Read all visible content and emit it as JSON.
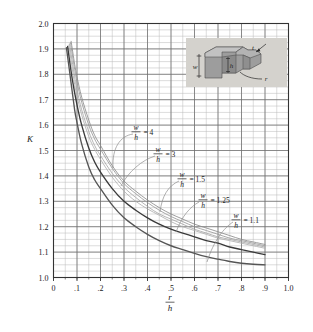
{
  "chart_data": {
    "type": "line",
    "title": "",
    "xlabel": "r/h",
    "xlabel_numerator": "r",
    "xlabel_denominator": "h",
    "ylabel": "K",
    "xlim": [
      0,
      1.0
    ],
    "ylim": [
      1.0,
      2.0
    ],
    "grid": true,
    "x_major_step": 0.1,
    "y_major_step": 0.1,
    "x_minor_step": 0.05,
    "y_minor_step": 0.025,
    "xticks": [
      "0",
      ".1",
      ".2",
      ".3",
      ".4",
      ".5",
      ".6",
      ".7",
      ".8",
      ".9",
      "1.0"
    ],
    "xtick_values": [
      0,
      0.1,
      0.2,
      0.3,
      0.4,
      0.5,
      0.6,
      0.7,
      0.8,
      0.9,
      1.0
    ],
    "yticks": [
      "1.0",
      "1.1",
      "1.2",
      "1.3",
      "1.4",
      "1.5",
      "1.6",
      "1.7",
      "1.8",
      "1.9",
      "2.0"
    ],
    "ytick_values": [
      1.0,
      1.1,
      1.2,
      1.3,
      1.4,
      1.5,
      1.6,
      1.7,
      1.8,
      1.9,
      2.0
    ],
    "legend_position": "inline-annotations",
    "series": [
      {
        "name": "w/h = 4",
        "label_numerator": "w",
        "label_denominator": "h",
        "label_value": "= 4",
        "color": "#8c8c8c",
        "x": [
          0.075,
          0.09,
          0.1,
          0.12,
          0.15,
          0.175,
          0.2,
          0.25,
          0.3,
          0.35,
          0.4,
          0.45,
          0.5,
          0.55,
          0.6,
          0.65,
          0.7,
          0.75,
          0.8,
          0.85,
          0.9
        ],
        "y": [
          1.93,
          1.84,
          1.79,
          1.71,
          1.62,
          1.56,
          1.52,
          1.44,
          1.38,
          1.34,
          1.305,
          1.275,
          1.25,
          1.23,
          1.21,
          1.195,
          1.18,
          1.165,
          1.15,
          1.14,
          1.13
        ]
      },
      {
        "name": "w/h = 3",
        "label_numerator": "w",
        "label_denominator": "h",
        "label_value": "= 3",
        "color": "#9a9a9a",
        "x": [
          0.072,
          0.09,
          0.1,
          0.12,
          0.15,
          0.175,
          0.2,
          0.25,
          0.3,
          0.35,
          0.4,
          0.45,
          0.5,
          0.55,
          0.6,
          0.65,
          0.7,
          0.75,
          0.8,
          0.85,
          0.9
        ],
        "y": [
          1.925,
          1.82,
          1.77,
          1.69,
          1.6,
          1.545,
          1.505,
          1.43,
          1.37,
          1.33,
          1.295,
          1.265,
          1.24,
          1.22,
          1.2,
          1.185,
          1.17,
          1.155,
          1.145,
          1.135,
          1.125
        ]
      },
      {
        "name": "w/h = 1.5",
        "label_numerator": "w",
        "label_denominator": "h",
        "label_value": "= 1.5",
        "color": "#a8a8a8",
        "x": [
          0.068,
          0.09,
          0.1,
          0.12,
          0.15,
          0.175,
          0.2,
          0.25,
          0.3,
          0.35,
          0.4,
          0.45,
          0.5,
          0.55,
          0.6,
          0.65,
          0.7,
          0.75,
          0.8,
          0.85,
          0.9
        ],
        "y": [
          1.92,
          1.79,
          1.74,
          1.66,
          1.575,
          1.52,
          1.48,
          1.41,
          1.355,
          1.315,
          1.28,
          1.25,
          1.23,
          1.21,
          1.19,
          1.175,
          1.16,
          1.15,
          1.14,
          1.13,
          1.12
        ]
      },
      {
        "name": "w/h = 1.25",
        "label_numerator": "w",
        "label_denominator": "h",
        "label_value": "= 1.25",
        "color": "#b0b0b0",
        "x": [
          0.065,
          0.09,
          0.1,
          0.12,
          0.15,
          0.175,
          0.2,
          0.25,
          0.3,
          0.35,
          0.4,
          0.45,
          0.5,
          0.55,
          0.6,
          0.65,
          0.7,
          0.75,
          0.8,
          0.85,
          0.9
        ],
        "y": [
          1.915,
          1.76,
          1.715,
          1.64,
          1.555,
          1.505,
          1.465,
          1.395,
          1.34,
          1.3,
          1.27,
          1.245,
          1.22,
          1.2,
          1.185,
          1.17,
          1.155,
          1.145,
          1.135,
          1.125,
          1.115
        ]
      },
      {
        "name": "w/h = 1.1",
        "label_numerator": "w",
        "label_denominator": "h",
        "label_value": "= 1.1",
        "color": "#3a3a3a",
        "x": [
          0.06,
          0.08,
          0.1,
          0.12,
          0.15,
          0.175,
          0.2,
          0.25,
          0.3,
          0.35,
          0.4,
          0.45,
          0.5,
          0.55,
          0.6,
          0.65,
          0.7,
          0.75,
          0.8,
          0.85,
          0.9
        ],
        "y": [
          1.91,
          1.78,
          1.68,
          1.6,
          1.51,
          1.455,
          1.415,
          1.35,
          1.3,
          1.265,
          1.235,
          1.21,
          1.19,
          1.175,
          1.16,
          1.145,
          1.135,
          1.12,
          1.11,
          1.1,
          1.09
        ]
      },
      {
        "name": "lower-bound-curve",
        "label_numerator": "",
        "label_denominator": "",
        "label_value": "",
        "color": "#555555",
        "x": [
          0.055,
          0.07,
          0.09,
          0.1,
          0.12,
          0.15,
          0.175,
          0.2,
          0.25,
          0.3,
          0.35,
          0.4,
          0.45,
          0.5,
          0.55,
          0.6,
          0.65,
          0.7,
          0.75,
          0.8,
          0.85,
          0.9
        ],
        "y": [
          1.905,
          1.8,
          1.66,
          1.61,
          1.525,
          1.435,
          1.385,
          1.35,
          1.285,
          1.235,
          1.2,
          1.17,
          1.145,
          1.125,
          1.11,
          1.095,
          1.082,
          1.072,
          1.063,
          1.056,
          1.052,
          1.05
        ]
      }
    ],
    "annotations": [
      {
        "name": "label-wh-4",
        "numerator": "w",
        "denominator": "h",
        "value": "= 4"
      },
      {
        "name": "label-wh-3",
        "numerator": "w",
        "denominator": "h",
        "value": "= 3"
      },
      {
        "name": "label-wh-1-5",
        "numerator": "w",
        "denominator": "h",
        "value": "= 1.5"
      },
      {
        "name": "label-wh-1-25",
        "numerator": "w",
        "denominator": "h",
        "value": "= 1.25"
      },
      {
        "name": "label-wh-1-1",
        "numerator": "w",
        "denominator": "h",
        "value": "= 1.1"
      }
    ],
    "inset": {
      "name": "stepped-bar-diagram",
      "labels": [
        "w",
        "h",
        "t",
        "r"
      ],
      "background": "#d4d2cd"
    },
    "colors": {
      "grid_major": "#6e6e6e",
      "grid_minor": "#b9b9b9",
      "axis": "#333333",
      "curve_dark": "#3a3a3a",
      "curve_light": "#a0a0a0",
      "background": "#ffffff"
    }
  }
}
